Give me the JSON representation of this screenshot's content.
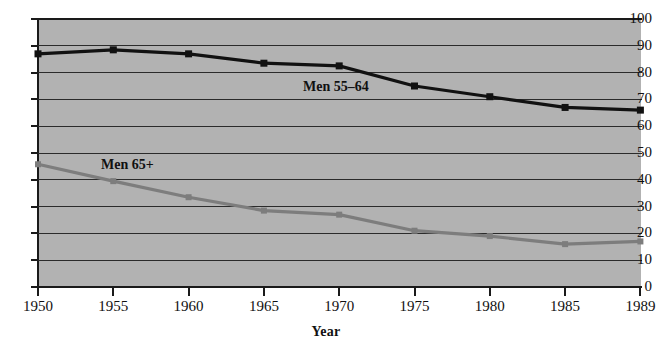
{
  "chart_data": {
    "type": "line",
    "title": "",
    "xlabel": "Year",
    "ylabel": "",
    "categories": [
      "1950",
      "1955",
      "1960",
      "1965",
      "1970",
      "1975",
      "1980",
      "1985",
      "1989"
    ],
    "yticks": [
      "0",
      "10",
      "20",
      "30",
      "40",
      "50",
      "60",
      "70",
      "80",
      "90",
      "100"
    ],
    "ylim": [
      0,
      100
    ],
    "grid": true,
    "legend_position": "inline-annotation",
    "series": [
      {
        "name": "Men 55–64",
        "color": "#111111",
        "marker": "square",
        "values": [
          87,
          88.5,
          87,
          83.5,
          82.5,
          75,
          71,
          67,
          66
        ]
      },
      {
        "name": "Men 65+",
        "color": "#7d7d7d",
        "marker": "square",
        "values": [
          45.8,
          39.5,
          33.5,
          28.5,
          27,
          21,
          19,
          16,
          17
        ]
      }
    ],
    "annotations": [
      {
        "text": "Men 55–64",
        "series": "Men 55–64"
      },
      {
        "text": "Men 65+",
        "series": "Men 65+"
      }
    ],
    "plot_background": "#b2b2b2",
    "gridline_color": "#2b2b2b",
    "axis_color": "#1a1a1a"
  }
}
